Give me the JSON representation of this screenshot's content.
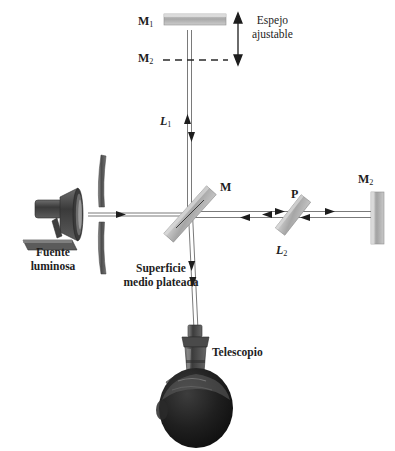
{
  "figure": {
    "labels": {
      "mirror_m1": "M",
      "mirror_m1_sub": "1",
      "mirror_m2_dashed": "M",
      "mirror_m2_dashed_sub": "2",
      "adjustable_mirror_line1": "Espejo",
      "adjustable_mirror_line2": "ajustable",
      "arm_l1": "L",
      "arm_l1_sub": "1",
      "arm_l2": "L",
      "arm_l2_sub": "2",
      "beamsplitter_m": "M",
      "compensator_p": "P",
      "mirror_m2_right": "M",
      "mirror_m2_right_sub": "2",
      "source_line1": "Fuente",
      "source_line2": "luminosa",
      "half_silvered_line1": "Superficie",
      "half_silvered_line2": "medio plateada",
      "telescope": "Telescopio"
    },
    "colors": {
      "ink": "#1d1d1d",
      "beam": "#6e6e6e",
      "mirror_light": "#b9b9b9",
      "mirror_mid": "#9a9a9a",
      "mirror_dark": "#6a6a6a",
      "aperture": "#5a5a5a",
      "lamp_body": "#474747",
      "head_dark": "#1a1a1a",
      "background": "#ffffff"
    },
    "geometry": {
      "beamsplitter_center_x": 190,
      "beamsplitter_center_y": 214,
      "mirror_m1_y": 22,
      "mirror_m2_dashed_y": 60,
      "mirror_m2_right_x": 376,
      "telescope_y": 330,
      "observer_head_y": 405
    }
  },
  "icons": {
    "arrow_up": "arrow-up",
    "arrow_down": "arrow-down",
    "arrow_left": "arrow-left",
    "arrow_right": "arrow-right",
    "double_arrow_vertical": "double-arrow-vertical"
  }
}
